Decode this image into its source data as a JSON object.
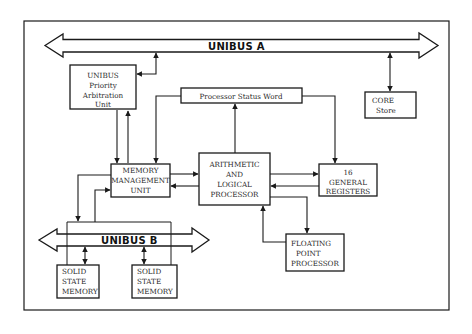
{
  "diagram": {
    "colors": {
      "line": "#1a1a1a",
      "background": "#ffffff"
    },
    "buses": [
      {
        "id": "unibus-a",
        "label": "UNIBUS A"
      },
      {
        "id": "unibus-b",
        "label": "UNIBUS B"
      }
    ],
    "nodes": {
      "arbitration": {
        "lines": [
          "UNIBUS",
          "Priority",
          "Arbitration",
          "Unit"
        ]
      },
      "psw": {
        "lines": [
          "Processor Status Word"
        ]
      },
      "core": {
        "lines": [
          "CORE",
          "Store"
        ]
      },
      "mmu": {
        "lines": [
          "MEMORY",
          "MANAGEMENT",
          "UNIT"
        ]
      },
      "alu": {
        "lines": [
          "ARITHMETIC",
          "AND",
          "LOGICAL",
          "PROCESSOR"
        ]
      },
      "registers": {
        "lines": [
          "16",
          "GENERAL",
          "REGISTERS"
        ]
      },
      "fpp": {
        "lines": [
          "FLOATING",
          "POINT",
          "PROCESSOR"
        ]
      },
      "ssm1": {
        "lines": [
          "SOLID",
          "STATE",
          "MEMORY"
        ]
      },
      "ssm2": {
        "lines": [
          "SOLID",
          "STATE",
          "MEMORY"
        ]
      }
    },
    "edges": [
      {
        "from": "unibus-a",
        "to": "arbitration",
        "type": "bidirectional"
      },
      {
        "from": "unibus-a",
        "to": "core",
        "type": "bidirectional"
      },
      {
        "from": "arbitration",
        "to": "mmu",
        "type": "directed"
      },
      {
        "from": "mmu",
        "to": "arbitration",
        "type": "directed"
      },
      {
        "from": "psw",
        "to": "mmu",
        "type": "directed"
      },
      {
        "from": "alu",
        "to": "psw",
        "type": "directed"
      },
      {
        "from": "psw",
        "to": "registers",
        "type": "directed"
      },
      {
        "from": "mmu",
        "to": "alu",
        "type": "directed"
      },
      {
        "from": "alu",
        "to": "mmu",
        "type": "directed"
      },
      {
        "from": "alu",
        "to": "registers",
        "type": "directed"
      },
      {
        "from": "registers",
        "to": "alu",
        "type": "directed"
      },
      {
        "from": "alu",
        "to": "fpp",
        "type": "directed"
      },
      {
        "from": "fpp",
        "to": "alu",
        "type": "directed"
      },
      {
        "from": "mmu",
        "to": "unibus-b",
        "type": "directed"
      },
      {
        "from": "unibus-b",
        "to": "mmu",
        "type": "directed"
      },
      {
        "from": "unibus-b",
        "to": "ssm1",
        "type": "bidirectional"
      },
      {
        "from": "unibus-b",
        "to": "ssm2",
        "type": "bidirectional"
      }
    ]
  }
}
